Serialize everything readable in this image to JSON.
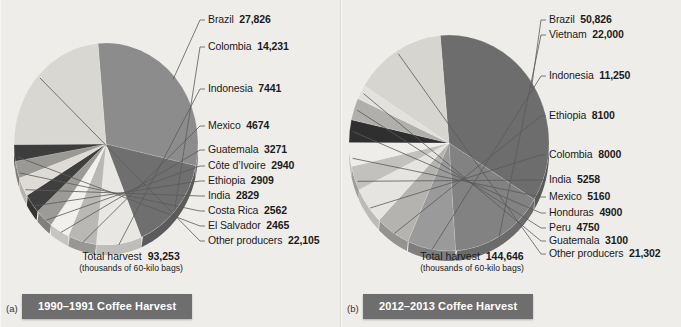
{
  "figure_a": {
    "panel_key": "(a)",
    "caption": "1990–1991 Coffee Harvest",
    "total_label": "Total harvest",
    "total_value": "93,253",
    "total_units": "(thousands of 60-kilo bags)",
    "labels": [
      {
        "name": "Brazil",
        "value": "27,826"
      },
      {
        "name": "Colombia",
        "value": "14,231"
      },
      {
        "name": "Indonesia",
        "value": "7441"
      },
      {
        "name": "Mexico",
        "value": "4674"
      },
      {
        "name": "Guatemala",
        "value": "3271"
      },
      {
        "name": "Côte d’Ivoire",
        "value": "2940"
      },
      {
        "name": "Ethiopia",
        "value": "2909"
      },
      {
        "name": "India",
        "value": "2829"
      },
      {
        "name": "Costa Rica",
        "value": "2562"
      },
      {
        "name": "El Salvador",
        "value": "2465"
      },
      {
        "name": "Other producers",
        "value": "22,105"
      }
    ]
  },
  "figure_b": {
    "panel_key": "(b)",
    "caption": "2012–2013 Coffee Harvest",
    "total_label": "Total harvest",
    "total_value": "144,646",
    "total_units": "(thousands of 60-kilo bags)",
    "labels": [
      {
        "name": "Brazil",
        "value": "50,826"
      },
      {
        "name": "Vietnam",
        "value": "22,000"
      },
      {
        "name": "Indonesia",
        "value": "11,250"
      },
      {
        "name": "Ethiopia",
        "value": "8100"
      },
      {
        "name": "Colombia",
        "value": "8000"
      },
      {
        "name": "India",
        "value": "5258"
      },
      {
        "name": "Mexico",
        "value": "5160"
      },
      {
        "name": "Honduras",
        "value": "4900"
      },
      {
        "name": "Peru",
        "value": "4750"
      },
      {
        "name": "Guatemala",
        "value": "3100"
      },
      {
        "name": "Other producers",
        "value": "21,302"
      }
    ]
  },
  "chart_data": [
    {
      "type": "pie",
      "title": "1990–1991 Coffee Harvest",
      "units": "thousands of 60-kilo bags",
      "total": 93253,
      "categories": [
        "Brazil",
        "Colombia",
        "Indonesia",
        "Mexico",
        "Guatemala",
        "Côte d’Ivoire",
        "Ethiopia",
        "India",
        "Costa Rica",
        "El Salvador",
        "Other producers"
      ],
      "values": [
        27826,
        14231,
        7441,
        4674,
        3271,
        2940,
        2909,
        2829,
        2562,
        2465,
        22105
      ],
      "colors": [
        "#8c8c8c",
        "#6f6f6f",
        "#e9e7e3",
        "#b9b8b4",
        "#f2f0ed",
        "#9c9b97",
        "#3f3f3f",
        "#dedbd6",
        "#9a9995",
        "#3d3d3d",
        "#d9d7d2"
      ],
      "legend": "right",
      "start_angle_deg": -95
    },
    {
      "type": "pie",
      "title": "2012–2013 Coffee Harvest",
      "units": "thousands of 60-kilo bags",
      "total": 144646,
      "categories": [
        "Brazil",
        "Vietnam",
        "Indonesia",
        "Ethiopia",
        "Colombia",
        "India",
        "Mexico",
        "Honduras",
        "Peru",
        "Guatemala",
        "Other producers"
      ],
      "values": [
        50826,
        22000,
        11250,
        8100,
        8000,
        5258,
        5160,
        4900,
        4750,
        3100,
        21302
      ],
      "colors": [
        "#6d6d6d",
        "#828282",
        "#9a9a9a",
        "#b4b3af",
        "#e6e4e0",
        "#c2c1bd",
        "#efedea",
        "#2f2f2f",
        "#b0afab",
        "#e3e1dd",
        "#d7d5d0"
      ],
      "legend": "right",
      "start_angle_deg": -95
    }
  ]
}
